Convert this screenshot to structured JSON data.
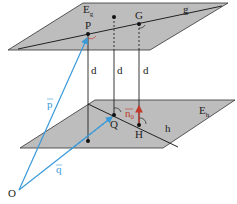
{
  "diagram": {
    "planes": {
      "upper": {
        "name": "E",
        "sub": "g",
        "fill": "#bdbdbd"
      },
      "lower": {
        "name": "E",
        "sub": "h",
        "fill": "#bdbdbd"
      }
    },
    "lines": {
      "upper": "g",
      "lower": "h"
    },
    "points": {
      "P": "P",
      "G": "G",
      "Q": "Q",
      "H": "H",
      "O": "O"
    },
    "distance_labels": [
      "d",
      "d",
      "d"
    ],
    "vectors": {
      "p": {
        "label": "p",
        "color": "#3a9ad9"
      },
      "q": {
        "label": "q",
        "color": "#3a9ad9"
      },
      "n0": {
        "label": "n",
        "sub": "0",
        "color": "#c0392b"
      }
    }
  }
}
